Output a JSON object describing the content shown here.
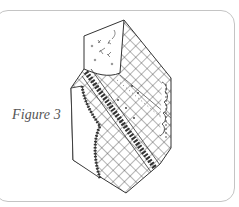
{
  "figure": {
    "caption": "Figure 3",
    "colors": {
      "frame_border": "#c4c4c4",
      "caption_text": "#555555",
      "ink": "#333333"
    }
  }
}
